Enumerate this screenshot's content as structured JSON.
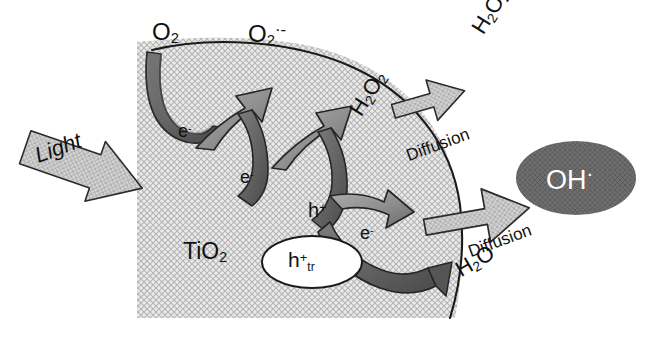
{
  "figure": {
    "substrate_label": "TiO2",
    "substrate_formula": {
      "base": "TiO",
      "sub": "2"
    }
  },
  "colors": {
    "background": "#ffffff",
    "particle_fill": "#e3e3e3",
    "particle_hatch": "#b9b9b9",
    "particle_outline": "#1a1a1a",
    "arrow_light": "#cfcfcf",
    "arrow_light_hatch": "#aaaaaa",
    "arrow_mid": "#9a9a9a",
    "arrow_dark": "#6f6f6f",
    "arrow_darkest": "#595959",
    "arrow_outline": "#262626",
    "oh_ellipse_fill": "#6e6e6e",
    "oh_text": "#ffffff",
    "htr_ellipse_fill": "#ffffff",
    "text": "#111111"
  },
  "labels": {
    "o2": {
      "text": "O2",
      "base": "O",
      "sub": "2"
    },
    "o2_radical": {
      "text": "O2·-",
      "base": "O",
      "sub": "2",
      "sup": "·-"
    },
    "electron_1": {
      "base": "e",
      "sup": "-"
    },
    "electron_2": {
      "base": "e",
      "sup": "-"
    },
    "electron_3": {
      "base": "e",
      "sup": "-"
    },
    "hole": {
      "base": "h",
      "sup": "+"
    },
    "hole_trapped": {
      "base": "h",
      "sup": "+",
      "sub": "tr"
    },
    "h2o2_surface": {
      "base_a": "H",
      "sub_a": "2",
      "base_b": "O",
      "sub_b": "2"
    },
    "h2o2_bulk": {
      "base_a": "H",
      "sub_a": "2",
      "base_b": "O",
      "sub_b": "2"
    },
    "h2o": {
      "base_a": "H",
      "sub_a": "2",
      "base_b": "O"
    },
    "oh_radical": {
      "base": "OH",
      "sup": "·"
    },
    "light": "Light",
    "diffusion_top": "Diffusion",
    "diffusion_bottom": "Diffusion",
    "tio2": {
      "base": "TiO",
      "sub": "2"
    }
  },
  "elements": {
    "light_arrow": "light-arrow",
    "h2o2_diffusion_arrow": "h2o2-diffusion-arrow",
    "oh_diffusion_arrow": "oh-diffusion-arrow",
    "o2_reduction_arrow": "o2-reduction-arrow",
    "superoxide_arrow": "superoxide-arrow",
    "h2o2_formation_arrow": "h2o2-formation-arrow",
    "hole_oxidation_arrow": "hole-oxidation-arrow",
    "water_oxidation_arrow": "water-oxidation-arrow"
  }
}
